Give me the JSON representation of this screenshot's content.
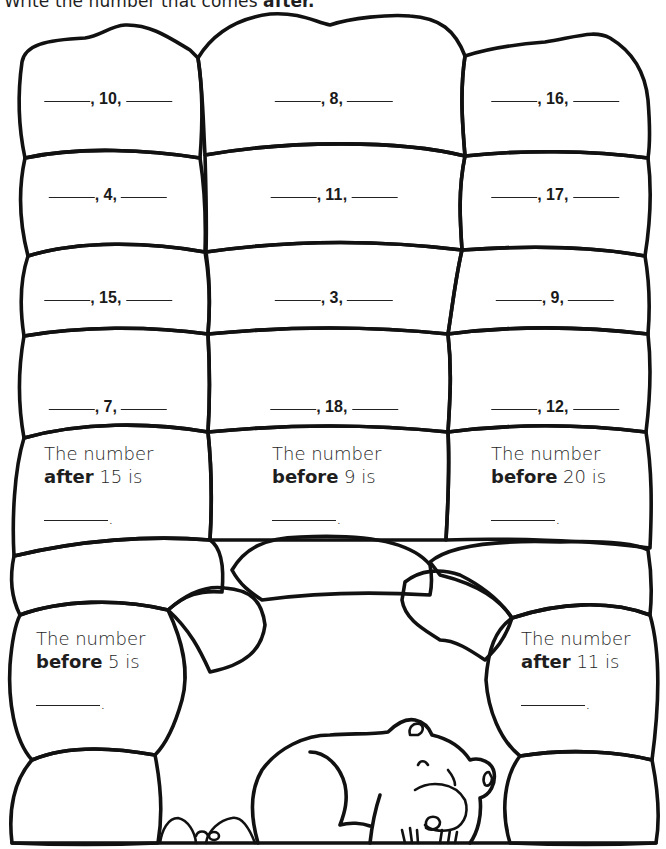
{
  "instruction": {
    "prefix": "Write the number that comes",
    "emphasis": "after."
  },
  "sequence_boxes": [
    {
      "number": "10"
    },
    {
      "number": "8"
    },
    {
      "number": "16"
    },
    {
      "number": "4"
    },
    {
      "number": "11"
    },
    {
      "number": "17"
    },
    {
      "number": "15"
    },
    {
      "number": "3"
    },
    {
      "number": "9"
    },
    {
      "number": "7"
    },
    {
      "number": "18"
    },
    {
      "number": "12"
    }
  ],
  "questions": [
    {
      "line1": "The number",
      "keyword": "after",
      "number": "15",
      "suffix": "is",
      "end": "."
    },
    {
      "line1": "The number",
      "keyword": "before",
      "number": "9",
      "suffix": "is",
      "end": "."
    },
    {
      "line1": "The number",
      "keyword": "before",
      "number": "20",
      "suffix": "is",
      "end": "."
    },
    {
      "line1": "The number",
      "keyword": "before",
      "number": "5",
      "suffix": "is",
      "end": "."
    },
    {
      "line1": "The number",
      "keyword": "after",
      "number": "11",
      "suffix": "is",
      "end": "."
    }
  ],
  "separator": ","
}
